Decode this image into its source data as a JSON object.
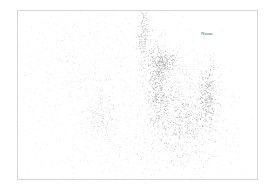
{
  "chart_data": {
    "type": "scatter",
    "title": "",
    "xlabel": "",
    "ylabel": "",
    "grid": false,
    "legend": null,
    "frame": {
      "x": 17,
      "y": 10,
      "w": 241,
      "h": 170
    },
    "annotations": [
      {
        "text": "Noun",
        "x": 201,
        "y": 36
      }
    ],
    "point_color": "#7a7a7a",
    "clusters": [
      {
        "name": "background-haze",
        "cx": 110,
        "cy": 95,
        "sx": 55,
        "sy": 45,
        "n": 900,
        "opacity": 0.18
      },
      {
        "name": "upper-left-diffuse",
        "cx": 75,
        "cy": 55,
        "sx": 35,
        "sy": 25,
        "n": 350,
        "opacity": 0.16
      },
      {
        "name": "top-stem",
        "cx": 143,
        "cy": 35,
        "sx": 3,
        "sy": 22,
        "n": 260,
        "opacity": 0.35
      },
      {
        "name": "central-trunk",
        "cx": 158,
        "cy": 88,
        "sx": 5,
        "sy": 22,
        "n": 420,
        "opacity": 0.45
      },
      {
        "name": "branch-tips",
        "cx": 163,
        "cy": 62,
        "sx": 8,
        "sy": 6,
        "n": 220,
        "opacity": 0.5
      },
      {
        "name": "right-arc",
        "cx": 208,
        "cy": 95,
        "sx": 5,
        "sy": 16,
        "n": 300,
        "opacity": 0.45
      },
      {
        "name": "right-body",
        "cx": 185,
        "cy": 115,
        "sx": 22,
        "sy": 25,
        "n": 700,
        "opacity": 0.3
      },
      {
        "name": "dense-spots",
        "cx": 182,
        "cy": 118,
        "sx": 12,
        "sy": 14,
        "n": 160,
        "opacity": 0.55
      },
      {
        "name": "left-loop",
        "cx": 100,
        "cy": 118,
        "sx": 9,
        "sy": 12,
        "n": 160,
        "opacity": 0.3
      },
      {
        "name": "lower-spread",
        "cx": 150,
        "cy": 150,
        "sx": 45,
        "sy": 14,
        "n": 350,
        "opacity": 0.16
      }
    ]
  }
}
